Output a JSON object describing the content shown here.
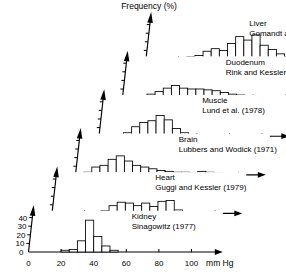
{
  "chart_data": {
    "type": "bar",
    "title": "",
    "ylabel": "Frequency (%)",
    "xlabel": "mm Hg",
    "xlim": [
      0,
      110
    ],
    "ylim": [
      0,
      45
    ],
    "grid": false,
    "legend_position": "in-panel",
    "x_tick_labels": [
      "0",
      "20",
      "40",
      "60",
      "80",
      "100"
    ],
    "x_tick_values": [
      0,
      20,
      40,
      60,
      80,
      100
    ],
    "y_tick_labels": [
      "0",
      "10",
      "20",
      "30",
      "40"
    ],
    "y_tick_values": [
      0,
      10,
      20,
      30,
      40
    ],
    "bin_width": 5,
    "note": "Oblique 3D stacked histogram panels; each panel is a pO2 frequency distribution for one organ",
    "series": [
      {
        "name": "Kidney",
        "title": "Kidney",
        "subtitle": "Sinagowitz (1977)",
        "panel_index": 0,
        "bin_starts": [
          20,
          25,
          30,
          35,
          40,
          45,
          50
        ],
        "values": [
          2,
          3,
          13,
          37,
          18,
          7,
          2
        ]
      },
      {
        "name": "Heart",
        "title": "Heart",
        "subtitle": "Guggi and Kessler (1979)",
        "panel_index": 1,
        "bin_starts": [
          25,
          30,
          35,
          40,
          45,
          50,
          55,
          60,
          65,
          70,
          75
        ],
        "values": [
          2,
          3,
          9,
          13,
          12,
          9,
          12,
          8,
          14,
          15,
          4
        ]
      },
      {
        "name": "Brain",
        "title": "Brain",
        "subtitle": "Lubbers and Wodick (1971)",
        "panel_index": 2,
        "bin_starts": [
          5,
          10,
          15,
          20,
          25,
          30,
          35,
          40,
          45,
          50,
          55,
          60,
          65,
          70,
          75,
          80,
          85,
          90
        ],
        "values": [
          3,
          9,
          11,
          18,
          22,
          16,
          11,
          9,
          7,
          5,
          4,
          3,
          3,
          2,
          4,
          3,
          2,
          1
        ]
      },
      {
        "name": "Muscle",
        "title": "Muscle",
        "subtitle": "Lund et al. (1978)",
        "panel_index": 3,
        "bin_starts": [
          15,
          20,
          25,
          30,
          35,
          40,
          45,
          50,
          55
        ],
        "values": [
          4,
          11,
          16,
          18,
          24,
          19,
          9,
          4,
          2
        ]
      },
      {
        "name": "Duodenum",
        "title": "Duodenum",
        "subtitle": "Rink and Kessler (1973)",
        "panel_index": 4,
        "bin_starts": [
          10,
          15,
          20,
          25,
          30,
          35,
          40,
          45,
          50,
          55,
          60,
          65,
          70,
          75
        ],
        "values": [
          2,
          4,
          7,
          11,
          14,
          11,
          10,
          10,
          9,
          8,
          6,
          4,
          3,
          1
        ]
      },
      {
        "name": "Liver",
        "title": "Liver",
        "subtitle": "Gomandt and Kessler (1973)",
        "panel_index": 5,
        "bin_starts": [
          25,
          30,
          35,
          40,
          45,
          50,
          55,
          60,
          65,
          70,
          75,
          80,
          85,
          90,
          95,
          100
        ],
        "values": [
          3,
          4,
          9,
          12,
          10,
          18,
          26,
          22,
          28,
          16,
          11,
          6,
          3,
          3,
          3,
          2
        ]
      }
    ]
  },
  "labels": {
    "ylabel": "Frequency (%)",
    "xlabel": "mm Hg"
  }
}
